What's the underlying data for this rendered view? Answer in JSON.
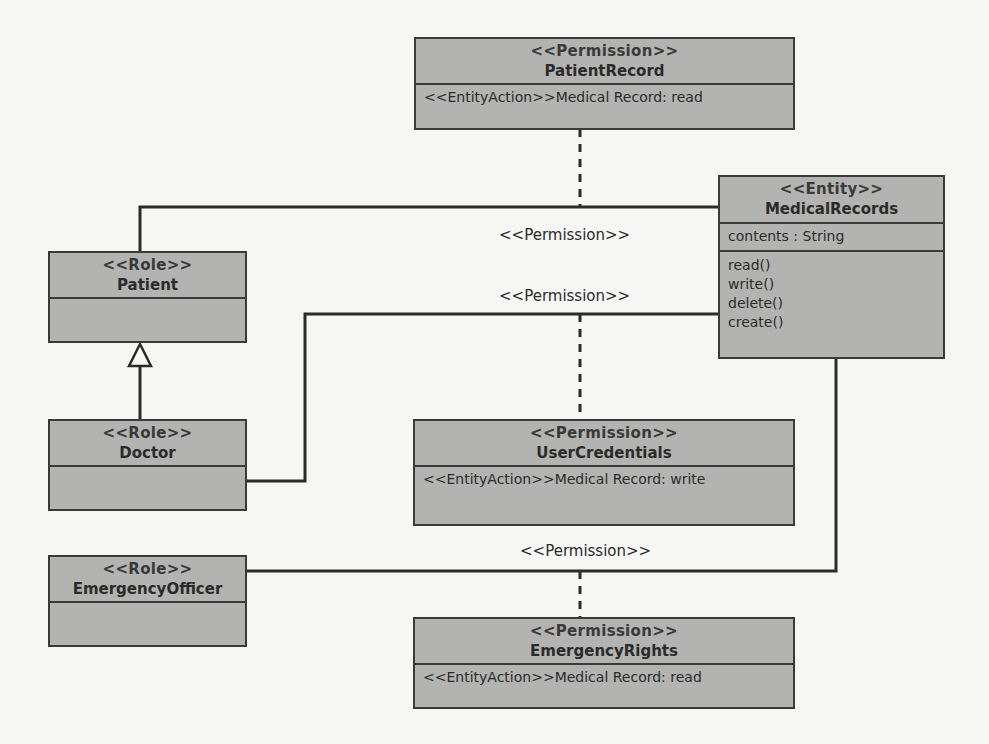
{
  "diagram": {
    "type": "UML class diagram",
    "colors": {
      "background": "#f6f6f4",
      "box_fill": "#b3b3b1",
      "line": "#2b2b2b"
    },
    "entity": {
      "stereotype": "<<Entity>>",
      "name": "MedicalRecords",
      "attributes": [
        "contents : String"
      ],
      "operations": [
        "read()",
        "write()",
        "delete()",
        "create()"
      ]
    },
    "roles": [
      {
        "stereotype": "<<Role>>",
        "name": "Patient"
      },
      {
        "stereotype": "<<Role>>",
        "name": "Doctor"
      },
      {
        "stereotype": "<<Role>>",
        "name": "EmergencyOfficer"
      }
    ],
    "permissions": [
      {
        "stereotype": "<<Permission>>",
        "name": "PatientRecord",
        "action": "<<EntityAction>>Medical Record: read"
      },
      {
        "stereotype": "<<Permission>>",
        "name": "UserCredentials",
        "action": "<<EntityAction>>Medical Record: write"
      },
      {
        "stereotype": "<<Permission>>",
        "name": "EmergencyRights",
        "action": "<<EntityAction>>Medical Record: read"
      }
    ],
    "association_labels": [
      "<<Permission>>",
      "<<Permission>>",
      "<<Permission>>"
    ],
    "relationships": [
      {
        "from": "Patient",
        "to": "MedicalRecords",
        "kind": "association",
        "label": "<<Permission>>",
        "association_class": "PatientRecord"
      },
      {
        "from": "Doctor",
        "to": "MedicalRecords",
        "kind": "association",
        "label": "<<Permission>>",
        "association_class": "UserCredentials"
      },
      {
        "from": "EmergencyOfficer",
        "to": "MedicalRecords",
        "kind": "association",
        "label": "<<Permission>>",
        "association_class": "EmergencyRights"
      },
      {
        "from": "Doctor",
        "to": "Patient",
        "kind": "generalization"
      }
    ]
  }
}
